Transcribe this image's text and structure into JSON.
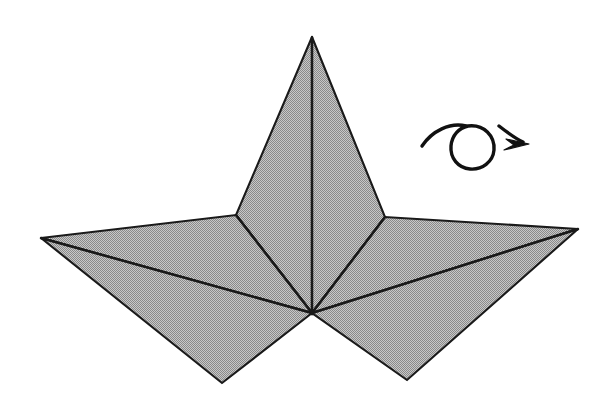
{
  "figure": {
    "canvas": {
      "width": 611,
      "height": 406
    },
    "background_color": "#ffffff",
    "fill_color": "#a9a9a9",
    "line_color": "#1a1a1a",
    "fill_style": "dithered-halftone-gray",
    "vertices": {
      "apex": [
        312,
        37
      ],
      "center": [
        312,
        313
      ],
      "left_tip": [
        41,
        238
      ],
      "right_tip": [
        578,
        229
      ],
      "left_junction": [
        236,
        215
      ],
      "right_junction": [
        385,
        217
      ],
      "bottom_left_tip": [
        222,
        383
      ],
      "bottom_right_tip": [
        407,
        380
      ]
    },
    "facets": [
      {
        "name": "pyramid-left-face",
        "points": "312,37 236,215 312,313"
      },
      {
        "name": "pyramid-right-face",
        "points": "312,37 385,217 312,313"
      },
      {
        "name": "left-upper-wing",
        "points": "41,238 236,215 312,313"
      },
      {
        "name": "right-upper-wing",
        "points": "578,229 385,217 312,313"
      },
      {
        "name": "left-lower-lobe",
        "points": "41,238 312,313 222,383"
      },
      {
        "name": "right-lower-lobe",
        "points": "578,229 312,313 407,380"
      }
    ],
    "creases": [
      {
        "name": "central-ridge",
        "d": "M 312,37 L 312,313"
      },
      {
        "name": "left-wing-fold",
        "d": "M 41,238 L 312,313"
      },
      {
        "name": "right-wing-fold",
        "d": "M 578,229 L 312,313"
      },
      {
        "name": "left-pyramid-fold",
        "d": "M 236,215 L 312,313"
      },
      {
        "name": "right-pyramid-fold",
        "d": "M 385,217 L 312,313"
      }
    ],
    "rotation_symbol": {
      "name": "rotation-indicator",
      "arc_d": "M 422,146 C 432,131 450,122 466,126",
      "circle_d": "M 468,126 C 484,124 495,136 494,150 C 493,162 482,170 470,169 C 458,168 450,158 451,146 C 452,135 459,128 468,126",
      "tail_d": "M 499,126 C 508,133 516,139 523,142",
      "arrowhead_points": "529,144 506,139 514,145 504,150",
      "arrow_direction": "clockwise",
      "meaning": "rotate"
    }
  }
}
